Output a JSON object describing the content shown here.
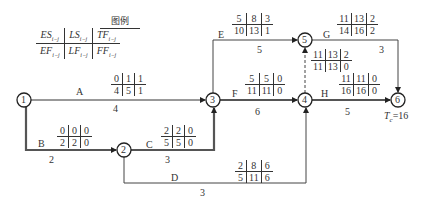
{
  "legend": {
    "title": "图例",
    "top": [
      "ES",
      "LS",
      "TF"
    ],
    "bottom": [
      "EF",
      "LF",
      "FF"
    ],
    "subscript": "i−j"
  },
  "nodes": [
    {
      "id": "1",
      "x": 24,
      "y": 100
    },
    {
      "id": "2",
      "x": 124,
      "y": 150
    },
    {
      "id": "3",
      "x": 213,
      "y": 100
    },
    {
      "id": "4",
      "x": 305,
      "y": 100
    },
    {
      "id": "5",
      "x": 305,
      "y": 40
    },
    {
      "id": "6",
      "x": 398,
      "y": 100
    }
  ],
  "activities": [
    {
      "name": "A",
      "duration": "4",
      "grid": {
        "top": [
          "0",
          "1",
          "1"
        ],
        "bottom": [
          "4",
          "5",
          "1"
        ]
      }
    },
    {
      "name": "B",
      "duration": "2",
      "grid": {
        "top": [
          "0",
          "0",
          "0"
        ],
        "bottom": [
          "2",
          "2",
          "0"
        ]
      }
    },
    {
      "name": "C",
      "duration": "3",
      "grid": {
        "top": [
          "2",
          "2",
          "0"
        ],
        "bottom": [
          "5",
          "5",
          "0"
        ]
      }
    },
    {
      "name": "D",
      "duration": "3",
      "grid": {
        "top": [
          "2",
          "8",
          "6"
        ],
        "bottom": [
          "5",
          "11",
          "6"
        ]
      }
    },
    {
      "name": "E",
      "duration": "5",
      "grid": {
        "top": [
          "5",
          "8",
          "3"
        ],
        "bottom": [
          "10",
          "13",
          "1"
        ]
      }
    },
    {
      "name": "F",
      "duration": "6",
      "grid": {
        "top": [
          "5",
          "5",
          "0"
        ],
        "bottom": [
          "11",
          "11",
          "0"
        ]
      }
    },
    {
      "name": "G",
      "duration": "3",
      "grid": {
        "top": [
          "11",
          "13",
          "2"
        ],
        "bottom": [
          "14",
          "16",
          "2"
        ]
      }
    },
    {
      "name": "H",
      "duration": "5",
      "grid": {
        "top": [
          "11",
          "11",
          "0"
        ],
        "bottom": [
          "16",
          "16",
          "0"
        ]
      }
    },
    {
      "name": "dummy",
      "duration": "",
      "grid": {
        "top": [
          "11",
          "13",
          "2"
        ],
        "bottom": [
          "11",
          "13",
          "0"
        ]
      }
    }
  ],
  "tc_label": "T",
  "tc_sub": "c",
  "tc_value": "=16"
}
